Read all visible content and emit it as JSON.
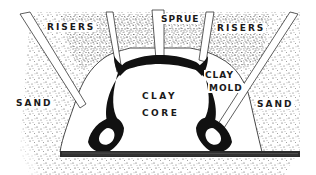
{
  "diagram": {
    "labels": {
      "risers_left": "RISERS",
      "sprue": "SPRUE",
      "risers_right": "RISERS",
      "sand_left": "SAND",
      "sand_right": "SAND",
      "clay_mold_line1": "CLAY",
      "clay_mold_line2": "MOLD",
      "clay_core_line1": "CLAY",
      "clay_core_line2": "CORE"
    },
    "colors": {
      "ink": "#1a1a1a",
      "paper": "#ffffff",
      "stipple": "#2a2a2a"
    }
  }
}
